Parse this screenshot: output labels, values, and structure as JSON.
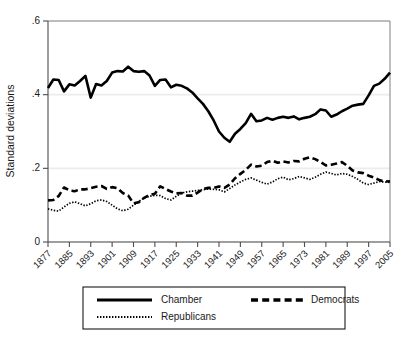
{
  "chart_data": {
    "type": "line",
    "title": "",
    "subtitle": "",
    "xlabel": "",
    "ylabel": "Standard deviations",
    "ylim": [
      0,
      0.6
    ],
    "xlim": [
      1877,
      2005
    ],
    "yticks": [
      "0",
      ".2",
      ".4",
      ".6"
    ],
    "ytick_values": [
      0,
      0.2,
      0.4,
      0.6
    ],
    "xticks": [
      "1877",
      "1885",
      "1893",
      "1901",
      "1909",
      "1917",
      "1925",
      "1933",
      "1941",
      "1949",
      "1957",
      "1965",
      "1973",
      "1981",
      "1989",
      "1997",
      "2005"
    ],
    "xtick_values": [
      1877,
      1885,
      1893,
      1901,
      1909,
      1917,
      1925,
      1933,
      1941,
      1949,
      1957,
      1965,
      1973,
      1981,
      1989,
      1997,
      2005
    ],
    "grid": "horizontal",
    "legend_position": "bottom",
    "x": [
      1877,
      1879,
      1881,
      1883,
      1885,
      1887,
      1889,
      1891,
      1893,
      1895,
      1897,
      1899,
      1901,
      1903,
      1905,
      1907,
      1909,
      1911,
      1913,
      1915,
      1917,
      1919,
      1921,
      1923,
      1925,
      1927,
      1929,
      1931,
      1933,
      1935,
      1937,
      1939,
      1941,
      1943,
      1945,
      1947,
      1949,
      1951,
      1953,
      1955,
      1957,
      1959,
      1961,
      1963,
      1965,
      1967,
      1969,
      1971,
      1973,
      1975,
      1977,
      1979,
      1981,
      1983,
      1985,
      1987,
      1989,
      1991,
      1993,
      1995,
      1997,
      1999,
      2001,
      2003,
      2005
    ],
    "series": [
      {
        "name": "Chamber",
        "style": "solid",
        "color": "#000000",
        "values": [
          0.418,
          0.441,
          0.44,
          0.409,
          0.428,
          0.425,
          0.437,
          0.451,
          0.392,
          0.429,
          0.425,
          0.437,
          0.46,
          0.464,
          0.463,
          0.476,
          0.464,
          0.462,
          0.464,
          0.452,
          0.424,
          0.44,
          0.441,
          0.42,
          0.427,
          0.424,
          0.417,
          0.406,
          0.39,
          0.375,
          0.355,
          0.33,
          0.3,
          0.283,
          0.272,
          0.294,
          0.307,
          0.323,
          0.348,
          0.328,
          0.33,
          0.337,
          0.332,
          0.337,
          0.34,
          0.337,
          0.341,
          0.333,
          0.337,
          0.34,
          0.347,
          0.36,
          0.357,
          0.34,
          0.346,
          0.355,
          0.362,
          0.37,
          0.373,
          0.375,
          0.398,
          0.424,
          0.43,
          0.443,
          0.46
        ]
      },
      {
        "name": "Democrats",
        "style": "dashed",
        "color": "#000000",
        "values": [
          0.113,
          0.114,
          0.125,
          0.148,
          0.14,
          0.138,
          0.143,
          0.143,
          0.146,
          0.15,
          0.152,
          0.144,
          0.149,
          0.146,
          0.133,
          0.126,
          0.105,
          0.108,
          0.12,
          0.128,
          0.131,
          0.151,
          0.144,
          0.137,
          0.132,
          0.133,
          0.126,
          0.126,
          0.134,
          0.144,
          0.147,
          0.147,
          0.151,
          0.147,
          0.156,
          0.173,
          0.185,
          0.196,
          0.21,
          0.205,
          0.207,
          0.217,
          0.221,
          0.215,
          0.219,
          0.216,
          0.22,
          0.219,
          0.226,
          0.23,
          0.225,
          0.217,
          0.208,
          0.21,
          0.213,
          0.217,
          0.207,
          0.194,
          0.189,
          0.187,
          0.18,
          0.175,
          0.168,
          0.164,
          0.165
        ]
      },
      {
        "name": "Republicans",
        "style": "dotted",
        "color": "#000000",
        "values": [
          0.09,
          0.086,
          0.084,
          0.095,
          0.105,
          0.109,
          0.104,
          0.098,
          0.104,
          0.112,
          0.114,
          0.11,
          0.1,
          0.09,
          0.085,
          0.089,
          0.1,
          0.11,
          0.12,
          0.124,
          0.127,
          0.126,
          0.118,
          0.114,
          0.124,
          0.133,
          0.136,
          0.138,
          0.14,
          0.142,
          0.144,
          0.143,
          0.142,
          0.136,
          0.145,
          0.155,
          0.163,
          0.17,
          0.174,
          0.168,
          0.162,
          0.157,
          0.163,
          0.172,
          0.176,
          0.169,
          0.172,
          0.178,
          0.174,
          0.17,
          0.176,
          0.184,
          0.19,
          0.186,
          0.182,
          0.186,
          0.184,
          0.178,
          0.17,
          0.16,
          0.156,
          0.16,
          0.164,
          0.163,
          0.162
        ]
      }
    ]
  },
  "axes": {
    "ylabel": "Standard deviations",
    "ytick_labels": [
      "0",
      ".2",
      ".4",
      ".6"
    ],
    "xtick_labels": [
      "1877",
      "1885",
      "1893",
      "1901",
      "1909",
      "1917",
      "1925",
      "1933",
      "1941",
      "1949",
      "1957",
      "1965",
      "1973",
      "1981",
      "1989",
      "1997",
      "2005"
    ]
  },
  "legend": {
    "entries": [
      {
        "label": "Chamber",
        "style": "solid"
      },
      {
        "label": "Democrats",
        "style": "dashed"
      },
      {
        "label": "Republicans",
        "style": "dotted"
      }
    ]
  },
  "colors": {
    "line": "#000000",
    "grid": "#ececed",
    "axis": "#4d4d4d",
    "frame": "#8a8a8a",
    "background": "#ffffff",
    "text": "#1a1a1a"
  }
}
